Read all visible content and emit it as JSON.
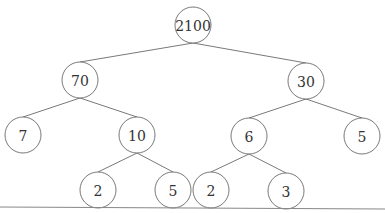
{
  "diagram": {
    "type": "tree",
    "colors": {
      "stroke": "#6a6a6a",
      "text": "#333333",
      "background": "#ffffff"
    },
    "radius": 18,
    "nodes": [
      {
        "id": "n0",
        "label": "2100",
        "x": 193,
        "y": 25
      },
      {
        "id": "n1",
        "label": "70",
        "x": 80,
        "y": 80
      },
      {
        "id": "n2",
        "label": "30",
        "x": 306,
        "y": 81
      },
      {
        "id": "n3",
        "label": "7",
        "x": 23,
        "y": 135
      },
      {
        "id": "n4",
        "label": "10",
        "x": 137,
        "y": 135
      },
      {
        "id": "n5",
        "label": "6",
        "x": 249,
        "y": 136
      },
      {
        "id": "n6",
        "label": "5",
        "x": 362,
        "y": 136
      },
      {
        "id": "n7",
        "label": "2",
        "x": 98,
        "y": 190
      },
      {
        "id": "n8",
        "label": "5",
        "x": 173,
        "y": 190
      },
      {
        "id": "n9",
        "label": "2",
        "x": 211,
        "y": 190
      },
      {
        "id": "n10",
        "label": "3",
        "x": 286,
        "y": 191
      }
    ],
    "edges": [
      [
        "n0",
        "n1"
      ],
      [
        "n0",
        "n2"
      ],
      [
        "n1",
        "n3"
      ],
      [
        "n1",
        "n4"
      ],
      [
        "n2",
        "n5"
      ],
      [
        "n2",
        "n6"
      ],
      [
        "n4",
        "n7"
      ],
      [
        "n4",
        "n8"
      ],
      [
        "n5",
        "n9"
      ],
      [
        "n5",
        "n10"
      ]
    ],
    "baseline": {
      "x1": 0,
      "y1": 207,
      "x2": 385,
      "y2": 209
    }
  }
}
